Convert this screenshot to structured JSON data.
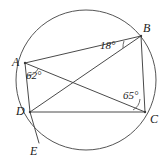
{
  "figure": {
    "type": "circle-geometry-diagram",
    "background_color": "#ffffff",
    "stroke_color": "#4a4a4a",
    "text_color": "#1a1a1a",
    "circle": {
      "name": "circumscribed-circle",
      "center_x": 86,
      "center_y": 80,
      "radius": 70
    },
    "points": [
      {
        "id": "A",
        "label": "A",
        "x": 25,
        "y": 63
      },
      {
        "id": "B",
        "label": "B",
        "x": 141,
        "y": 36
      },
      {
        "id": "C",
        "label": "C",
        "x": 145,
        "y": 112
      },
      {
        "id": "D",
        "label": "D",
        "x": 30,
        "y": 112
      },
      {
        "id": "E",
        "label": "E",
        "x": 39,
        "y": 143
      }
    ],
    "segments": [
      {
        "id": "AB",
        "from": "A",
        "to": "B"
      },
      {
        "id": "BC",
        "from": "B",
        "to": "C"
      },
      {
        "id": "DC",
        "from": "D",
        "to": "C"
      },
      {
        "id": "AD",
        "from": "A",
        "to": "D"
      },
      {
        "id": "AC",
        "from": "A",
        "to": "C"
      },
      {
        "id": "BD",
        "from": "B",
        "to": "D"
      },
      {
        "id": "DE",
        "from": "D",
        "to": "E"
      }
    ],
    "angles": [
      {
        "id": "angle-at-B",
        "label": "18°",
        "value": 18,
        "vertex": "B",
        "between": [
          "BA",
          "BD"
        ]
      },
      {
        "id": "angle-at-A",
        "label": "62°",
        "value": 62,
        "vertex": "A",
        "between": [
          "AD",
          "AC"
        ]
      },
      {
        "id": "angle-at-C",
        "label": "65°",
        "value": 65,
        "vertex": "C",
        "between": [
          "CD",
          "CB"
        ]
      }
    ]
  }
}
